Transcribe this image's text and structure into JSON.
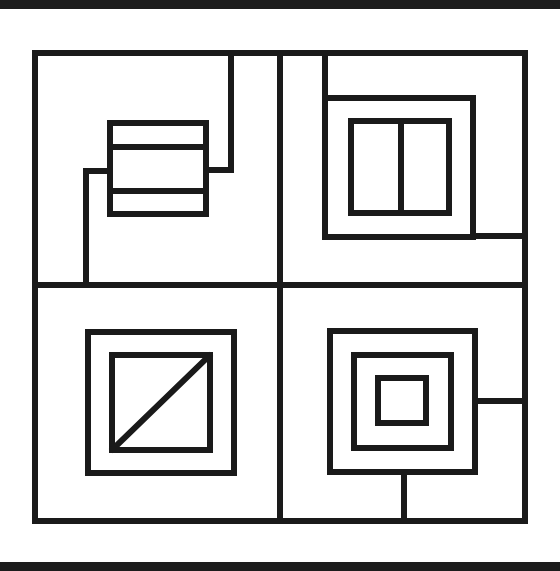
{
  "diagram": {
    "type": "geometric-line-puzzle",
    "stroke_color": "#1a1a1a",
    "background_color": "#ffffff",
    "frame_bar_color": "#1c1c1c",
    "quadrants": [
      {
        "position": "top-left",
        "description": "rectangle divided into three horizontal bands, connected by stepped lines to top border and bottom divider"
      },
      {
        "position": "top-right",
        "description": "rectangle split by vertical divider, inside an open frame attached to top border and right border"
      },
      {
        "position": "bottom-left",
        "description": "square with diagonal line inside a larger concentric square"
      },
      {
        "position": "bottom-right",
        "description": "three concentric squares with connectors to right border and bottom border"
      }
    ]
  }
}
